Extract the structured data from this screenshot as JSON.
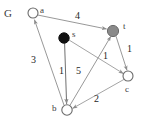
{
  "figure": {
    "name": "G",
    "width": 144,
    "height": 127,
    "background": "#ffffff"
  },
  "style": {
    "edge_color": "#8c8c8c",
    "node_stroke": "#6b6b6b",
    "node_hollow_fill": "#ffffff",
    "node_source_fill": "#111111",
    "node_sink_fill": "#8a8a8a",
    "text_color": "#2b2b2b"
  },
  "nodes": [
    {
      "id": "a",
      "label": "a",
      "x": 33,
      "y": 13,
      "r": 5.0,
      "fill": "hollow",
      "label_x": 40,
      "label_y": 6
    },
    {
      "id": "s",
      "label": "s",
      "x": 64,
      "y": 38,
      "r": 5.2,
      "fill": "black",
      "label_x": 72,
      "label_y": 30
    },
    {
      "id": "t",
      "label": "t",
      "x": 113,
      "y": 31,
      "r": 5.6,
      "fill": "gray",
      "label_x": 123,
      "label_y": 22
    },
    {
      "id": "c",
      "label": "c",
      "x": 128,
      "y": 76,
      "r": 5.0,
      "fill": "hollow",
      "label_x": 125,
      "label_y": 85
    },
    {
      "id": "b",
      "label": "b",
      "x": 67,
      "y": 110,
      "r": 5.2,
      "fill": "hollow",
      "label_x": 52,
      "label_y": 104
    }
  ],
  "edges": [
    {
      "id": "a-t",
      "from": "a",
      "to": "t",
      "weight": "4",
      "label_x": 75,
      "label_y": 11,
      "directed": true
    },
    {
      "id": "b-a",
      "from": "b",
      "to": "a",
      "weight": "3",
      "label_x": 31,
      "label_y": 55,
      "directed": true
    },
    {
      "id": "s-b",
      "from": "s",
      "to": "b",
      "weight": "1",
      "label_x": 59,
      "label_y": 66,
      "directed": true
    },
    {
      "id": "b-t",
      "from": "b",
      "to": "t",
      "weight": "5",
      "label_x": 76,
      "label_y": 66,
      "directed": true
    },
    {
      "id": "s-c",
      "from": "s",
      "to": "c",
      "weight": "1",
      "label_x": 103,
      "label_y": 51,
      "directed": true
    },
    {
      "id": "t-c",
      "from": "t",
      "to": "c",
      "weight": "1",
      "label_x": 127,
      "label_y": 44,
      "directed": true
    },
    {
      "id": "c-b",
      "from": "c",
      "to": "b",
      "weight": "2",
      "label_x": 94,
      "label_y": 94,
      "directed": true
    }
  ],
  "graph_label": {
    "text": "G",
    "x": 4,
    "y": 8
  }
}
